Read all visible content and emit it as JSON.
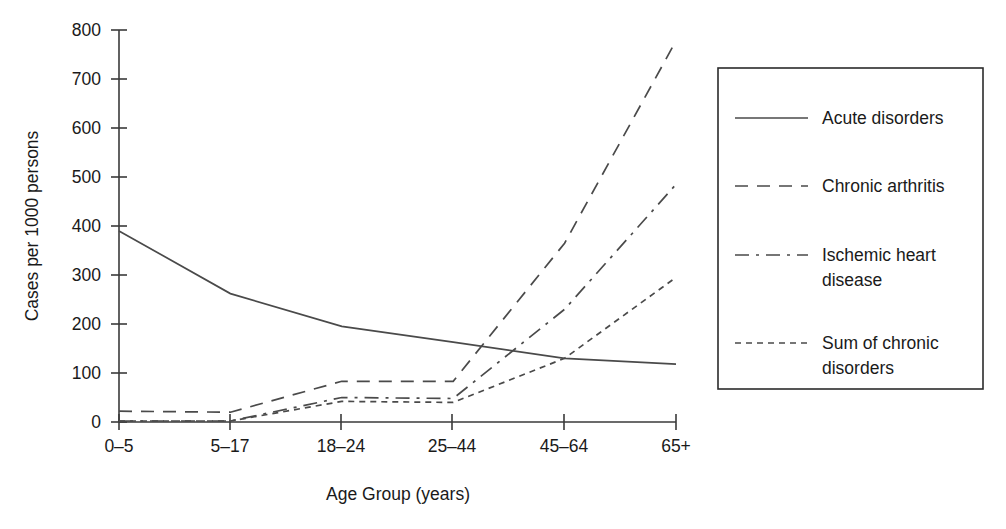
{
  "chart_data": {
    "type": "line",
    "title": "",
    "xlabel": "Age Group (years)",
    "ylabel": "Cases per 1000 persons",
    "categories": [
      "0–5",
      "5–17",
      "18–24",
      "25–44",
      "45–64",
      "65+"
    ],
    "ylim": [
      0,
      800
    ],
    "yticks": [
      0,
      100,
      200,
      300,
      400,
      500,
      600,
      700,
      800
    ],
    "grid": false,
    "legend_position": "right",
    "series": [
      {
        "name": "Acute disorders",
        "dash": "solid",
        "values": [
          390,
          262,
          195,
          163,
          130,
          118
        ]
      },
      {
        "name": "Chronic arthritis",
        "dash": "long-dash",
        "values": [
          22,
          20,
          83,
          83,
          365,
          778
        ]
      },
      {
        "name": "Ischemic heart disease",
        "dash": "dash-dot",
        "values": [
          2,
          2,
          50,
          48,
          230,
          485
        ]
      },
      {
        "name": "Sum of chronic disorders",
        "dash": "short-dash",
        "values": [
          2,
          2,
          42,
          40,
          130,
          295
        ]
      }
    ]
  },
  "legend": {
    "entries": [
      {
        "label": "Acute disorders"
      },
      {
        "label": "Chronic arthritis"
      },
      {
        "label": "Ischemic heart"
      },
      {
        "label": "disease"
      },
      {
        "label": "Sum of chronic"
      },
      {
        "label": "disorders"
      }
    ]
  },
  "axes": {
    "y_title": "Cases per 1000 persons",
    "x_title": "Age Group (years)",
    "y_tick_labels": [
      "0",
      "100",
      "200",
      "300",
      "400",
      "500",
      "600",
      "700",
      "800"
    ],
    "x_tick_labels": [
      "0–5",
      "5–17",
      "18–24",
      "25–44",
      "45–64",
      "65+"
    ]
  },
  "colors": {
    "ink": "#1a1a1a",
    "line": "#4a4a4a",
    "axis": "#3a3a3a",
    "background": "#ffffff"
  }
}
